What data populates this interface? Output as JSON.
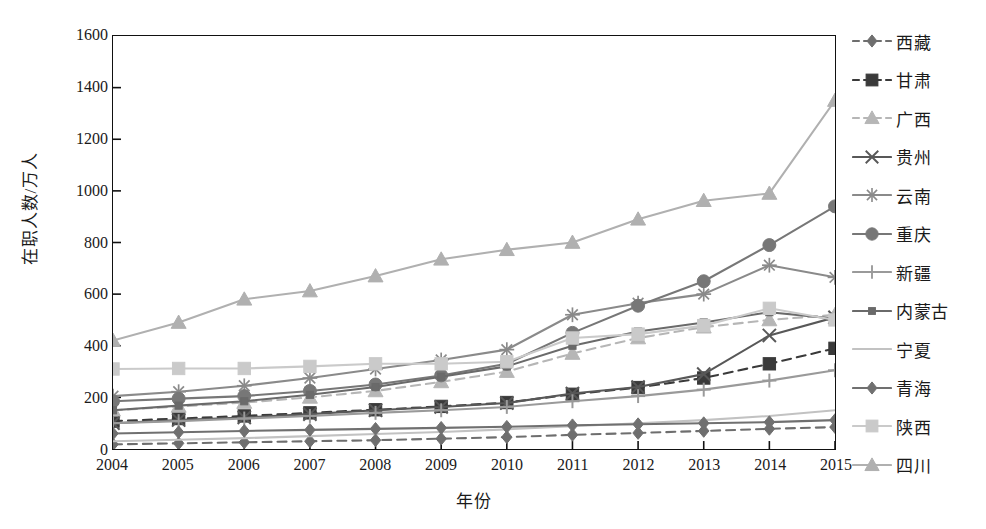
{
  "chart_data": {
    "type": "line",
    "title": "",
    "xlabel": "年份",
    "ylabel": "在职人数/万人",
    "grid": false,
    "legend_position": "right",
    "x": [
      "2004",
      "2005",
      "2006",
      "2007",
      "2008",
      "2009",
      "2010",
      "2011",
      "2012",
      "2013",
      "2014",
      "2015"
    ],
    "xlim": [
      2004,
      2015
    ],
    "ylim": [
      0,
      1600
    ],
    "yticks": [
      0,
      200,
      400,
      600,
      800,
      1000,
      1200,
      1400,
      1600
    ],
    "series": [
      {
        "name": "西藏",
        "color": "#6e6e6e",
        "marker": "diamond",
        "dash": "dashed",
        "values": [
          18,
          22,
          26,
          30,
          34,
          40,
          46,
          55,
          62,
          70,
          78,
          85
        ]
      },
      {
        "name": "甘肃",
        "color": "#3a3a3a",
        "marker": "square",
        "dash": "dashed",
        "values": [
          108,
          118,
          128,
          140,
          152,
          165,
          180,
          212,
          238,
          275,
          330,
          390
        ]
      },
      {
        "name": "广西",
        "color": "#b6b6b6",
        "marker": "triangle",
        "dash": "dashed",
        "values": [
          150,
          165,
          180,
          200,
          225,
          260,
          300,
          370,
          430,
          472,
          500,
          520
        ]
      },
      {
        "name": "贵州",
        "color": "#585858",
        "marker": "x",
        "dash": "solid",
        "values": [
          100,
          112,
          122,
          135,
          150,
          163,
          178,
          215,
          240,
          290,
          440,
          510
        ]
      },
      {
        "name": "云南",
        "color": "#8a8a8a",
        "marker": "star",
        "dash": "solid",
        "values": [
          205,
          222,
          245,
          275,
          310,
          345,
          385,
          520,
          565,
          600,
          712,
          665
        ]
      },
      {
        "name": "重庆",
        "color": "#777777",
        "marker": "circle",
        "dash": "solid",
        "values": [
          185,
          195,
          205,
          225,
          250,
          285,
          330,
          450,
          555,
          650,
          790,
          940
        ]
      },
      {
        "name": "新疆",
        "color": "#9a9a9a",
        "marker": "plus",
        "dash": "solid",
        "values": [
          100,
          108,
          118,
          128,
          140,
          150,
          163,
          185,
          205,
          230,
          265,
          305
        ]
      },
      {
        "name": "内蒙古",
        "color": "#6a6a6a",
        "marker": "smallsquare",
        "dash": "solid",
        "values": [
          150,
          168,
          185,
          210,
          240,
          280,
          320,
          400,
          455,
          490,
          530,
          505
        ]
      },
      {
        "name": "宁夏",
        "color": "#c2c2c2",
        "marker": "none",
        "dash": "solid",
        "values": [
          30,
          36,
          42,
          50,
          58,
          66,
          76,
          88,
          100,
          112,
          128,
          150
        ]
      },
      {
        "name": "青海",
        "color": "#707070",
        "marker": "diamond",
        "dash": "solid",
        "values": [
          60,
          65,
          70,
          74,
          78,
          82,
          86,
          92,
          96,
          100,
          104,
          112
        ]
      },
      {
        "name": "陕西",
        "color": "#cacaca",
        "marker": "square",
        "dash": "solid",
        "values": [
          310,
          312,
          312,
          320,
          330,
          330,
          338,
          430,
          445,
          478,
          545,
          500
        ]
      },
      {
        "name": "四川",
        "color": "#b0b0b0",
        "marker": "triangle",
        "dash": "solid",
        "values": [
          420,
          490,
          580,
          612,
          670,
          735,
          772,
          800,
          890,
          962,
          990,
          1350
        ]
      }
    ]
  }
}
